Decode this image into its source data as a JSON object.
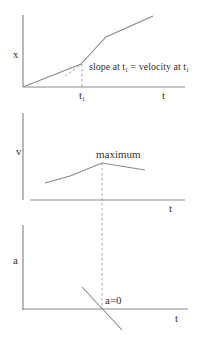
{
  "diagram": {
    "colors": {
      "line": "#8a8a8a",
      "text": "#333333",
      "background": "#ffffff"
    },
    "position_plot": {
      "y_label": "x",
      "x_label": "t",
      "tick_label": "t",
      "tick_subscript": "1",
      "annotation": {
        "part1": "slope at t",
        "sub1": "1",
        "part2": " = velocity at  t",
        "sub2": "1"
      }
    },
    "velocity_plot": {
      "y_label": "v",
      "x_label": "t",
      "annotation": "maximum"
    },
    "acceleration_plot": {
      "y_label": "a",
      "x_label": "t",
      "annotation": "a=0"
    }
  }
}
